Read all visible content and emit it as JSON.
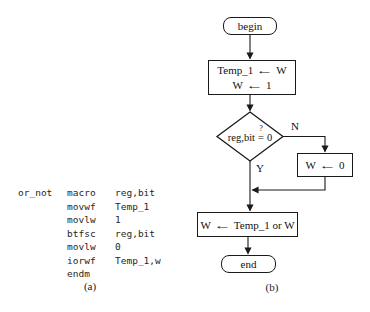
{
  "figure": {
    "caption_a": "(a)",
    "caption_b": "(b)"
  },
  "code": {
    "lines": [
      {
        "label": "or_not",
        "opcode": "macro",
        "operand": "reg,bit"
      },
      {
        "label": "",
        "opcode": "movwf",
        "operand": "Temp_1"
      },
      {
        "label": "",
        "opcode": "movlw",
        "operand": "1"
      },
      {
        "label": "",
        "opcode": "btfsc",
        "operand": "reg,bit"
      },
      {
        "label": "",
        "opcode": "movlw",
        "operand": "0"
      },
      {
        "label": "",
        "opcode": "iorwf",
        "operand": "Temp_1,w"
      },
      {
        "label": "",
        "opcode": "endm",
        "operand": ""
      }
    ]
  },
  "flowchart": {
    "begin": "begin",
    "end": "end",
    "box1_line1": {
      "lhs": "Temp_1",
      "rhs": "W"
    },
    "box1_line2": {
      "lhs": "W",
      "rhs": "1"
    },
    "decision": {
      "text": "reg,bit",
      "op": "=",
      "mark": "?",
      "value": "0"
    },
    "branch_no": "N",
    "branch_yes": "Y",
    "box_no": {
      "lhs": "W",
      "rhs": "0"
    },
    "box_or": {
      "lhs": "W",
      "rhs": "Temp_1 or W"
    }
  },
  "icons": {
    "assign_arrow": "←"
  },
  "colors": {
    "ink": "#1a1a1a",
    "background": "#ffffff"
  }
}
